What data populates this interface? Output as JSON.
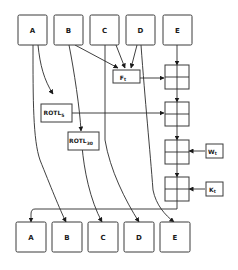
{
  "diagram": {
    "inputs": [
      {
        "id": "A",
        "label": "A"
      },
      {
        "id": "B",
        "label": "B"
      },
      {
        "id": "C",
        "label": "C"
      },
      {
        "id": "D",
        "label": "D"
      },
      {
        "id": "E",
        "label": "E"
      }
    ],
    "outputs": [
      {
        "id": "A",
        "label": "A"
      },
      {
        "id": "B",
        "label": "B"
      },
      {
        "id": "C",
        "label": "C"
      },
      {
        "id": "D",
        "label": "D"
      },
      {
        "id": "E",
        "label": "E"
      }
    ],
    "operations": {
      "f": {
        "label": "F",
        "sub": "t"
      },
      "rotl5": {
        "label": "ROTL",
        "sub": "5"
      },
      "rotl30": {
        "label": "ROTL",
        "sub": "30"
      },
      "w": {
        "label": "W",
        "sub": "t"
      },
      "k": {
        "label": "K",
        "sub": "t"
      }
    },
    "adders": 4
  }
}
